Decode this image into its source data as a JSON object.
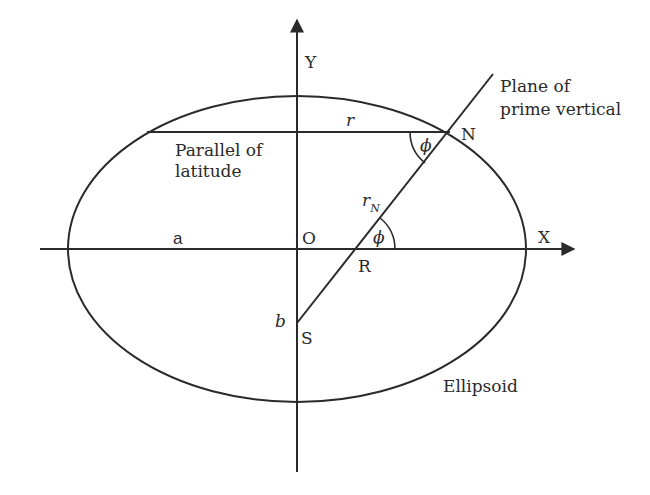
{
  "diagram": {
    "type": "geometry",
    "colors": {
      "line": "#2a2a2a",
      "background": "#ffffff"
    },
    "labels": {
      "y_axis": "Y",
      "x_axis": "X",
      "origin": "O",
      "semi_major": "a",
      "semi_minor": "b",
      "parallel_radius": "r",
      "point_n": "N",
      "point_r": "R",
      "point_s": "S",
      "normal_radius": "r",
      "normal_radius_sub": "N",
      "angle_at_n": "ϕ",
      "angle_at_r": "ϕ",
      "parallel_line_1": "Parallel of",
      "parallel_line_2": "latitude",
      "plane_line_1": "Plane of",
      "plane_line_2": "prime vertical",
      "ellipsoid": "Ellipsoid"
    },
    "geometry": {
      "ellipse": {
        "cx": 297,
        "cy": 249,
        "rx": 229,
        "ry": 153
      },
      "x_axis": {
        "x1": 40,
        "x2": 575,
        "y": 249
      },
      "y_axis": {
        "x": 297,
        "y1": 18,
        "y2": 472
      },
      "parallel": {
        "x1": 147,
        "x2": 450,
        "y": 132
      },
      "normal": {
        "x1": 297,
        "y1": 323,
        "x2": 493,
        "y2": 74
      }
    }
  }
}
